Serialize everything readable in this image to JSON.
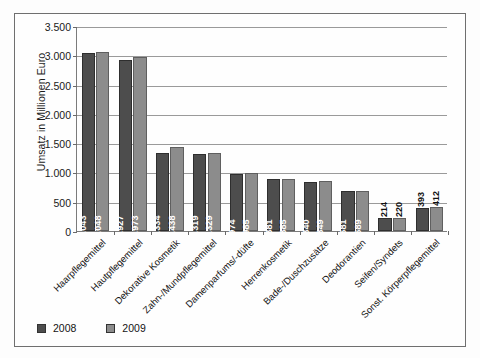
{
  "chart_data": {
    "type": "bar",
    "title": "",
    "xlabel": "",
    "ylabel": "Umsatz in Millionen Euro",
    "ylim": [
      0,
      3500
    ],
    "ytick_step": 500,
    "grid": true,
    "legend_position": "bottom-left",
    "categories": [
      "Haarpflegemittel",
      "Hautpflegemittel",
      "Dekorative Kosmetik",
      "Zahn-/Mundpflegemittel",
      "Damenparfums/-düfte",
      "Herrenkosmetik",
      "Bade-/Duschzusätze",
      "Deodorantien",
      "Seifen/Syndets",
      "Sonst. Körperpflegemittel"
    ],
    "ytick_labels": [
      "0",
      "500",
      "1.000",
      "1.500",
      "2.000",
      "2.500",
      "3.000",
      "3.500"
    ],
    "series": [
      {
        "name": "2008",
        "color": "#4d4d4d",
        "values": [
          3043,
          2927,
          1334,
          1319,
          974,
          881,
          840,
          681,
          214,
          393
        ],
        "labels": [
          "3.043",
          "2.927",
          "1.334",
          "1.319",
          "974",
          "881",
          "840",
          "681",
          "214",
          "393"
        ]
      },
      {
        "name": "2009",
        "color": "#8c8c8c",
        "values": [
          3048,
          2973,
          1438,
          1329,
          985,
          885,
          849,
          689,
          220,
          412
        ],
        "labels": [
          "3.048",
          "2.973",
          "1.438",
          "1.329",
          "985",
          "885",
          "849",
          "689",
          "220",
          "412"
        ]
      }
    ]
  }
}
